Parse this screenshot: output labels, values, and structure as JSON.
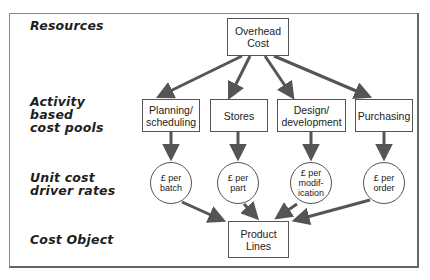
{
  "caption": "Figure: Activity based cost system",
  "row_labels": {
    "resources": "Resources",
    "activity_pools": "Activity\nbased\ncost pools",
    "driver_rates": "Unit cost\ndriver rates",
    "cost_object": "Cost Object"
  },
  "nodes": {
    "overhead": "Overhead\nCost",
    "pools": [
      {
        "id": "planning",
        "label": "Planning/\nscheduling"
      },
      {
        "id": "stores",
        "label": "Stores"
      },
      {
        "id": "design",
        "label": "Design/\ndevelopment"
      },
      {
        "id": "purchasing",
        "label": "Purchasing"
      }
    ],
    "rates": [
      {
        "id": "per-batch",
        "label": "£ per\nbatch"
      },
      {
        "id": "per-part",
        "label": "£ per\npart"
      },
      {
        "id": "per-modification",
        "label": "£ per\nmodif-\nication"
      },
      {
        "id": "per-order",
        "label": "£ per\norder"
      }
    ],
    "product": "Product\nLines"
  },
  "colors": {
    "arrow": "#555555",
    "border": "#555555",
    "text": "#222222"
  }
}
